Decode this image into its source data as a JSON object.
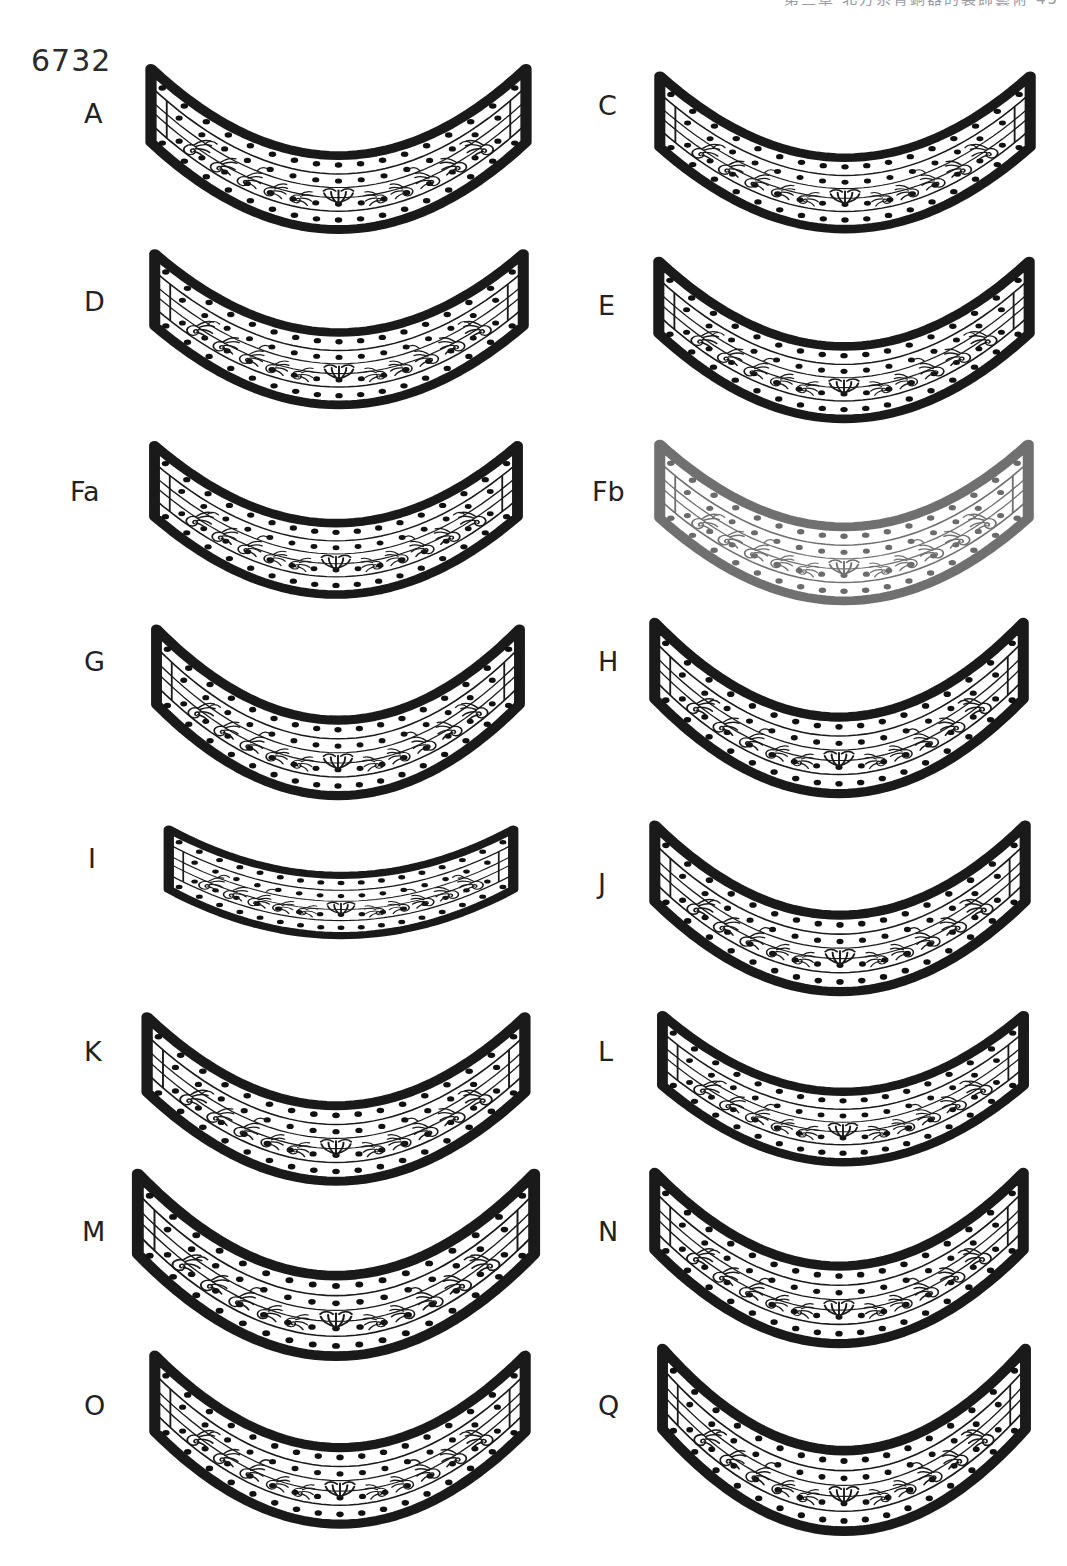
{
  "page": {
    "catalog_number": "6732",
    "running_header": "第三章 北方系青銅器的裝飾藝術   45",
    "background_color": "#ffffff",
    "ink_color": "#1a1a1a",
    "width": 1067,
    "height": 1566
  },
  "figure": {
    "kind": "archaeological-plate",
    "columns": 2,
    "rows": 8,
    "item_count": 16
  },
  "items": [
    {
      "label": "A",
      "column": "left",
      "row": 1,
      "x": 136,
      "y": 52,
      "w": 405,
      "h": 145,
      "sag": 0.8,
      "faded": false
    },
    {
      "label": "C",
      "column": "right",
      "row": 1,
      "x": 645,
      "y": 60,
      "w": 400,
      "h": 140,
      "sag": 0.78,
      "faded": false
    },
    {
      "label": "D",
      "column": "left",
      "row": 2,
      "x": 140,
      "y": 238,
      "w": 398,
      "h": 142,
      "sag": 0.74,
      "faded": false
    },
    {
      "label": "E",
      "column": "right",
      "row": 2,
      "x": 644,
      "y": 245,
      "w": 400,
      "h": 142,
      "sag": 0.8,
      "faded": false
    },
    {
      "label": "Fa",
      "column": "left",
      "row": 3,
      "x": 140,
      "y": 430,
      "w": 392,
      "h": 140,
      "sag": 0.74,
      "faded": false
    },
    {
      "label": "Fb",
      "column": "right",
      "row": 3,
      "x": 645,
      "y": 428,
      "w": 398,
      "h": 145,
      "sag": 0.76,
      "faded": true
    },
    {
      "label": "G",
      "column": "left",
      "row": 4,
      "x": 142,
      "y": 612,
      "w": 392,
      "h": 148,
      "sag": 0.82,
      "faded": false
    },
    {
      "label": "H",
      "column": "right",
      "row": 4,
      "x": 640,
      "y": 605,
      "w": 398,
      "h": 150,
      "sag": 0.84,
      "faded": false
    },
    {
      "label": "I",
      "column": "left",
      "row": 5,
      "x": 155,
      "y": 818,
      "w": 372,
      "h": 118,
      "sag": 0.52,
      "faded": false
    },
    {
      "label": "J",
      "column": "right",
      "row": 5,
      "x": 640,
      "y": 808,
      "w": 400,
      "h": 150,
      "sag": 0.8,
      "faded": false
    },
    {
      "label": "K",
      "column": "left",
      "row": 6,
      "x": 132,
      "y": 1000,
      "w": 408,
      "h": 148,
      "sag": 0.8,
      "faded": false
    },
    {
      "label": "L",
      "column": "right",
      "row": 6,
      "x": 648,
      "y": 1000,
      "w": 390,
      "h": 138,
      "sag": 0.74,
      "faded": false
    },
    {
      "label": "M",
      "column": "left",
      "row": 7,
      "x": 122,
      "y": 1155,
      "w": 428,
      "h": 158,
      "sag": 0.86,
      "faded": false
    },
    {
      "label": "N",
      "column": "right",
      "row": 7,
      "x": 640,
      "y": 1155,
      "w": 398,
      "h": 152,
      "sag": 0.82,
      "faded": false
    },
    {
      "label": "O",
      "column": "left",
      "row": 8,
      "x": 140,
      "y": 1338,
      "w": 400,
      "h": 150,
      "sag": 0.82,
      "faded": false
    },
    {
      "label": "Q",
      "column": "right",
      "row": 8,
      "x": 648,
      "y": 1330,
      "w": 392,
      "h": 158,
      "sag": 0.86,
      "faded": false
    }
  ],
  "label_positions": [
    {
      "label": "A",
      "x": 84,
      "y": 100
    },
    {
      "label": "C",
      "x": 598,
      "y": 92
    },
    {
      "label": "D",
      "x": 84,
      "y": 288
    },
    {
      "label": "E",
      "x": 598,
      "y": 292
    },
    {
      "label": "Fa",
      "x": 70,
      "y": 478
    },
    {
      "label": "Fb",
      "x": 592,
      "y": 478
    },
    {
      "label": "G",
      "x": 84,
      "y": 648
    },
    {
      "label": "H",
      "x": 598,
      "y": 648
    },
    {
      "label": "I",
      "x": 88,
      "y": 845
    },
    {
      "label": "J",
      "x": 598,
      "y": 870
    },
    {
      "label": "K",
      "x": 84,
      "y": 1038
    },
    {
      "label": "L",
      "x": 598,
      "y": 1038
    },
    {
      "label": "M",
      "x": 82,
      "y": 1218
    },
    {
      "label": "N",
      "x": 598,
      "y": 1218
    },
    {
      "label": "O",
      "x": 84,
      "y": 1392
    },
    {
      "label": "Q",
      "x": 598,
      "y": 1392
    }
  ]
}
